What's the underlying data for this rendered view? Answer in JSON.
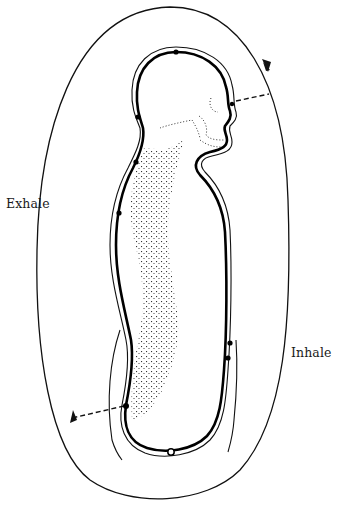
{
  "diagram": {
    "type": "breath-cycle-body-outline",
    "labels": {
      "exhale": "Exhale",
      "inhale": "Inhale"
    },
    "colors": {
      "line": "#111111",
      "background": "#ffffff",
      "spine_dots": "#333333"
    },
    "markers": [
      {
        "name": "crown-point",
        "x": 176,
        "y": 52,
        "kind": "filled"
      },
      {
        "name": "back-of-head-point",
        "x": 138,
        "y": 117,
        "kind": "filled"
      },
      {
        "name": "upper-back-point",
        "x": 136,
        "y": 162,
        "kind": "filled"
      },
      {
        "name": "mid-back-point",
        "x": 119,
        "y": 213,
        "kind": "filled"
      },
      {
        "name": "lower-back-point",
        "x": 126,
        "y": 406,
        "kind": "filled"
      },
      {
        "name": "perineum-point",
        "x": 171,
        "y": 452,
        "kind": "open"
      },
      {
        "name": "belly-point-upper",
        "x": 230,
        "y": 343,
        "kind": "filled"
      },
      {
        "name": "belly-point-lower",
        "x": 228,
        "y": 358,
        "kind": "filled"
      },
      {
        "name": "third-eye-point",
        "x": 232,
        "y": 104,
        "kind": "filled"
      }
    ]
  }
}
